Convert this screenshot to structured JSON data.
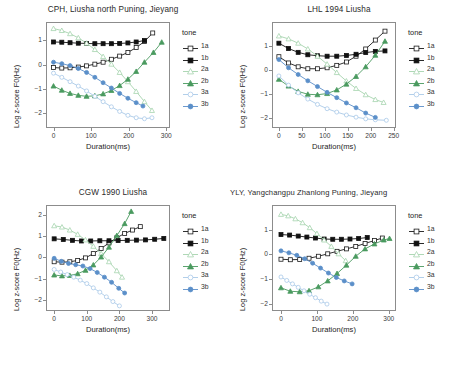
{
  "figure": {
    "axis_labels": {
      "x": "Duration(ms)",
      "y": "Log z-score F0(Hz)"
    },
    "legend_title": "tone",
    "series_defs": [
      {
        "key": "1a",
        "label": "1a",
        "color": "#1a1a1a",
        "marker": "square",
        "filled": false
      },
      {
        "key": "1b",
        "label": "1b",
        "color": "#111111",
        "marker": "square",
        "filled": true
      },
      {
        "key": "2a",
        "label": "2a",
        "color": "#a6d4ae",
        "marker": "triangle",
        "filled": false
      },
      {
        "key": "2b",
        "label": "2b",
        "color": "#4a9a5f",
        "marker": "triangle",
        "filled": true
      },
      {
        "key": "3a",
        "label": "3a",
        "color": "#a9c9e8",
        "marker": "circle",
        "filled": false
      },
      {
        "key": "3b",
        "label": "3b",
        "color": "#5b8fc9",
        "marker": "circle",
        "filled": true
      }
    ]
  },
  "chart_data": [
    {
      "id": "cph",
      "type": "line",
      "title": "CPH, Liusha north Puning, Jieyang",
      "xlabel": "Duration(ms)",
      "ylabel": "Log z-score F0(Hz)",
      "xlim": [
        -20,
        310
      ],
      "ylim": [
        -2.6,
        1.75
      ],
      "xticks": [
        0,
        100,
        200,
        300
      ],
      "yticks": [
        1,
        0,
        -1,
        -2
      ],
      "grid": false,
      "legend_position": "right",
      "series": [
        {
          "name": "1a",
          "x": [
            0,
            22,
            44,
            66,
            88,
            110,
            132,
            154,
            176,
            198,
            220,
            242,
            264
          ],
          "y": [
            -0.12,
            -0.14,
            -0.13,
            -0.1,
            -0.05,
            0.02,
            0.1,
            0.22,
            0.35,
            0.5,
            0.7,
            0.95,
            1.3
          ]
        },
        {
          "name": "1b",
          "x": [
            0,
            22,
            44,
            66,
            88,
            110,
            132,
            154,
            176,
            198,
            220,
            242
          ],
          "y": [
            0.93,
            0.92,
            0.9,
            0.88,
            0.87,
            0.86,
            0.86,
            0.86,
            0.87,
            0.89,
            0.93,
            0.99
          ]
        },
        {
          "name": "2a",
          "x": [
            0,
            22,
            44,
            66,
            88,
            110,
            132,
            154,
            176,
            198,
            220,
            242,
            262
          ],
          "y": [
            1.48,
            1.4,
            1.27,
            1.1,
            0.88,
            0.62,
            0.33,
            0.02,
            -0.32,
            -0.7,
            -1.1,
            -1.52,
            -1.88
          ]
        },
        {
          "name": "2b",
          "x": [
            0,
            22,
            44,
            66,
            88,
            110,
            132,
            154,
            176,
            198,
            220,
            242,
            266,
            288
          ],
          "y": [
            -0.88,
            -1.05,
            -1.18,
            -1.26,
            -1.3,
            -1.28,
            -1.2,
            -1.06,
            -0.86,
            -0.6,
            -0.28,
            0.1,
            0.5,
            0.92
          ]
        },
        {
          "name": "3a",
          "x": [
            0,
            22,
            44,
            66,
            88,
            110,
            132,
            154,
            176,
            198,
            220,
            242,
            262
          ],
          "y": [
            -0.35,
            -0.52,
            -0.7,
            -0.88,
            -1.08,
            -1.3,
            -1.52,
            -1.73,
            -1.92,
            -2.08,
            -2.18,
            -2.22,
            -2.18
          ]
        },
        {
          "name": "3b",
          "x": [
            0,
            22,
            44,
            66,
            88,
            110,
            132,
            154,
            176,
            198,
            220,
            238
          ],
          "y": [
            0.1,
            0.04,
            -0.04,
            -0.16,
            -0.32,
            -0.52,
            -0.74,
            -0.96,
            -1.18,
            -1.38,
            -1.56,
            -1.7
          ]
        }
      ]
    },
    {
      "id": "lhl",
      "type": "line",
      "title": "LHL 1994 Liusha",
      "xlabel": "Duration(ms)",
      "ylabel": "Log z-score F0(Hz)",
      "xlim": [
        -15,
        255
      ],
      "ylim": [
        -2.4,
        2.0
      ],
      "xticks": [
        0,
        50,
        100,
        150,
        200,
        250
      ],
      "yticks": [
        1,
        0,
        -1,
        -2
      ],
      "grid": false,
      "legend_position": "right",
      "series": [
        {
          "name": "1a",
          "x": [
            0,
            21,
            42,
            63,
            84,
            105,
            126,
            147,
            168,
            189,
            210,
            231
          ],
          "y": [
            0.56,
            0.3,
            0.14,
            0.06,
            0.06,
            0.1,
            0.2,
            0.34,
            0.58,
            0.88,
            1.25,
            1.62
          ]
        },
        {
          "name": "1b",
          "x": [
            0,
            21,
            42,
            63,
            84,
            105,
            126,
            147,
            168,
            189,
            210,
            231
          ],
          "y": [
            1.12,
            0.9,
            0.74,
            0.64,
            0.6,
            0.58,
            0.58,
            0.61,
            0.66,
            0.73,
            0.78,
            0.8
          ]
        },
        {
          "name": "2a",
          "x": [
            0,
            21,
            42,
            63,
            84,
            105,
            126,
            147,
            168,
            189,
            210,
            228
          ],
          "y": [
            1.42,
            1.3,
            1.12,
            0.88,
            0.58,
            0.25,
            -0.1,
            -0.45,
            -0.76,
            -1.02,
            -1.22,
            -1.34
          ]
        },
        {
          "name": "2b",
          "x": [
            0,
            21,
            42,
            63,
            84,
            105,
            126,
            147,
            168,
            189,
            210,
            231
          ],
          "y": [
            -0.38,
            -0.66,
            -0.88,
            -1.0,
            -1.02,
            -0.97,
            -0.82,
            -0.58,
            -0.26,
            0.14,
            0.62,
            1.2
          ]
        },
        {
          "name": "3a",
          "x": [
            0,
            21,
            42,
            63,
            84,
            105,
            126,
            147,
            168,
            189,
            210,
            234
          ],
          "y": [
            -0.24,
            -0.62,
            -0.94,
            -1.2,
            -1.42,
            -1.6,
            -1.74,
            -1.86,
            -1.95,
            -2.02,
            -2.06,
            -2.08
          ]
        },
        {
          "name": "3b",
          "x": [
            0,
            21,
            42,
            63,
            84,
            105,
            126,
            147,
            168,
            189,
            210
          ],
          "y": [
            0.44,
            0.1,
            -0.18,
            -0.44,
            -0.68,
            -0.92,
            -1.14,
            -1.36,
            -1.56,
            -1.78,
            -1.96
          ]
        }
      ]
    },
    {
      "id": "cgw",
      "type": "line",
      "title": "CGW 1990 Liusha",
      "xlabel": "Duration(ms)",
      "ylabel": "Log z-score F0(Hz)",
      "xlim": [
        -25,
        355
      ],
      "ylim": [
        -2.5,
        2.45
      ],
      "xticks": [
        0,
        100,
        200,
        300
      ],
      "yticks": [
        2,
        1,
        0,
        -1,
        -2
      ],
      "grid": false,
      "legend_position": "right",
      "series": [
        {
          "name": "1a",
          "x": [
            0,
            24,
            48,
            72,
            96,
            120,
            144,
            168,
            192,
            216,
            240,
            264
          ],
          "y": [
            -0.2,
            -0.22,
            -0.2,
            -0.14,
            -0.02,
            0.18,
            0.42,
            0.68,
            0.92,
            1.12,
            1.28,
            1.44
          ]
        },
        {
          "name": "1b",
          "x": [
            0,
            28,
            56,
            84,
            112,
            140,
            168,
            196,
            224,
            252,
            280,
            308,
            336
          ],
          "y": [
            0.87,
            0.84,
            0.8,
            0.77,
            0.77,
            0.78,
            0.78,
            0.79,
            0.8,
            0.81,
            0.82,
            0.85,
            0.89
          ]
        },
        {
          "name": "2a",
          "x": [
            0,
            24,
            48,
            72,
            96,
            120,
            144,
            168,
            192,
            208
          ],
          "y": [
            1.48,
            1.42,
            1.28,
            1.08,
            0.82,
            0.52,
            0.18,
            -0.2,
            -0.62,
            -0.92
          ]
        },
        {
          "name": "2b",
          "x": [
            0,
            24,
            48,
            72,
            96,
            120,
            144,
            168,
            192,
            216,
            236
          ],
          "y": [
            -0.82,
            -0.86,
            -0.84,
            -0.76,
            -0.6,
            -0.35,
            0.02,
            0.48,
            1.02,
            1.58,
            2.15
          ]
        },
        {
          "name": "3a",
          "x": [
            0,
            20,
            40,
            60,
            80,
            100,
            120,
            140,
            160,
            180,
            200
          ],
          "y": [
            -0.56,
            -0.68,
            -0.8,
            -0.92,
            -1.06,
            -1.22,
            -1.42,
            -1.62,
            -1.84,
            -2.06,
            -2.26
          ]
        },
        {
          "name": "3b",
          "x": [
            0,
            22,
            44,
            66,
            88,
            110,
            132,
            154,
            176,
            198,
            216
          ],
          "y": [
            -0.04,
            -0.18,
            -0.28,
            -0.34,
            -0.4,
            -0.52,
            -0.7,
            -0.92,
            -1.16,
            -1.44,
            -1.66
          ]
        }
      ]
    },
    {
      "id": "yly",
      "type": "line",
      "title": "YLY, Yangchangpu Zhanlong Puning, Jieyang",
      "xlabel": "Duration(ms)",
      "ylabel": "Log z-score F0(Hz)",
      "xlim": [
        -25,
        320
      ],
      "ylim": [
        -2.3,
        2.0
      ],
      "xticks": [
        0,
        100,
        200,
        300
      ],
      "yticks": [
        1,
        0,
        -1,
        -2
      ],
      "grid": false,
      "legend_position": "right",
      "series": [
        {
          "name": "1a",
          "x": [
            0,
            26,
            52,
            78,
            104,
            130,
            156,
            182,
            208,
            234,
            260,
            282
          ],
          "y": [
            -0.2,
            -0.22,
            -0.21,
            -0.16,
            -0.08,
            0.02,
            0.12,
            0.22,
            0.32,
            0.44,
            0.56,
            0.66
          ]
        },
        {
          "name": "1b",
          "x": [
            0,
            24,
            48,
            72,
            96,
            120,
            144,
            168,
            192,
            216,
            240
          ],
          "y": [
            0.8,
            0.78,
            0.74,
            0.7,
            0.66,
            0.62,
            0.61,
            0.61,
            0.62,
            0.64,
            0.68
          ]
        },
        {
          "name": "2a",
          "x": [
            0,
            20,
            40,
            60,
            80,
            100,
            120,
            140,
            160,
            180
          ],
          "y": [
            1.62,
            1.56,
            1.44,
            1.28,
            1.08,
            0.84,
            0.58,
            0.32,
            0.02,
            -0.26
          ]
        },
        {
          "name": "2b",
          "x": [
            0,
            26,
            52,
            78,
            104,
            130,
            156,
            182,
            208,
            234,
            260,
            286,
            302
          ],
          "y": [
            -1.36,
            -1.5,
            -1.52,
            -1.48,
            -1.32,
            -1.08,
            -0.78,
            -0.44,
            -0.08,
            0.22,
            0.42,
            0.58,
            0.64
          ]
        },
        {
          "name": "3a",
          "x": [
            0,
            16,
            32,
            48,
            64,
            80,
            96,
            112,
            128
          ],
          "y": [
            -0.92,
            -1.06,
            -1.2,
            -1.34,
            -1.48,
            -1.62,
            -1.76,
            -1.9,
            -2.02
          ]
        },
        {
          "name": "3b",
          "x": [
            0,
            22,
            44,
            66,
            88,
            110,
            132,
            154,
            176,
            198
          ],
          "y": [
            0.14,
            0.06,
            -0.04,
            -0.18,
            -0.36,
            -0.56,
            -0.76,
            -0.94,
            -1.08,
            -1.2
          ]
        }
      ]
    }
  ]
}
